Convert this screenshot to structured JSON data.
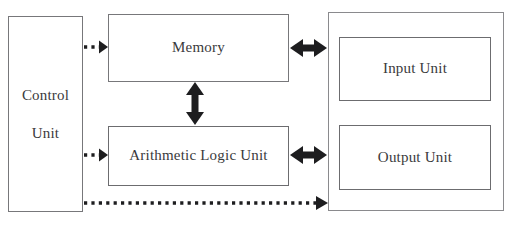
{
  "diagram": {
    "blocks": [
      {
        "id": "control_unit",
        "label": "Control\nUnit"
      },
      {
        "id": "memory",
        "label": "Memory"
      },
      {
        "id": "alu",
        "label": "Arithmetic Logic Unit"
      },
      {
        "id": "input_unit",
        "label": "Input Unit"
      },
      {
        "id": "output_unit",
        "label": "Output Unit"
      },
      {
        "id": "io_container",
        "label": ""
      }
    ],
    "connectors": [
      {
        "id": "control_to_memory",
        "style": "dotted",
        "direction": "unidirectional",
        "from": "control_unit",
        "to": "memory"
      },
      {
        "id": "control_to_alu",
        "style": "dotted",
        "direction": "unidirectional",
        "from": "control_unit",
        "to": "alu"
      },
      {
        "id": "control_to_io",
        "style": "dotted",
        "direction": "unidirectional",
        "from": "control_unit",
        "to": "io_container"
      },
      {
        "id": "memory_to_alu",
        "style": "solid",
        "direction": "bidirectional",
        "from": "memory",
        "to": "alu"
      },
      {
        "id": "memory_to_io",
        "style": "solid",
        "direction": "bidirectional",
        "from": "memory",
        "to": "io_container"
      },
      {
        "id": "alu_to_io",
        "style": "solid",
        "direction": "bidirectional",
        "from": "alu",
        "to": "io_container"
      }
    ],
    "colors": {
      "line": "#1d1d1f",
      "box_border": "#6e6e70",
      "text": "#3a3a3c",
      "background": "#ffffff"
    }
  }
}
